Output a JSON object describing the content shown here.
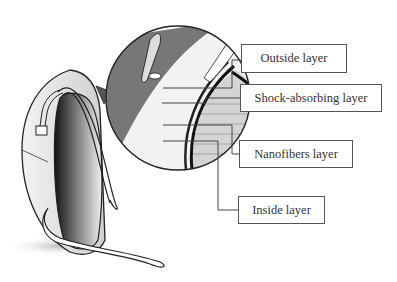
{
  "diagram": {
    "layers": [
      {
        "id": "outside",
        "label": "Outside layer"
      },
      {
        "id": "shock",
        "label": "Shock-absorbing layer"
      },
      {
        "id": "nanofibers",
        "label": "Nanofibers layer"
      },
      {
        "id": "inside",
        "label": "Inside layer"
      }
    ],
    "colors": {
      "line": "#444444",
      "box_border": "#555555",
      "text": "#333333",
      "shade_dark": "#555555",
      "shade_mid": "#9a9a9a",
      "shade_light": "#d9d9d9"
    }
  }
}
